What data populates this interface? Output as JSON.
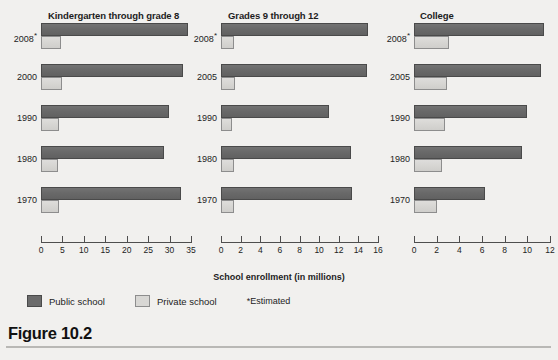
{
  "figure": {
    "caption": "Figure 10.2"
  },
  "chart_data": {
    "type": "bar",
    "orientation": "horizontal",
    "title": "",
    "xlabel": "School enrollment (in millions)",
    "ylabel": "",
    "grid": false,
    "legend_position": "bottom-left",
    "legend": [
      {
        "name": "Public school",
        "color": "#6b6b6b"
      },
      {
        "name": "Private school",
        "color": "#d8d7d4"
      }
    ],
    "note": "*Estimated",
    "panels": [
      {
        "title": "Kindergarten through grade 8",
        "categories": [
          "2008*",
          "2000",
          "1990",
          "1980",
          "1970"
        ],
        "xlim": [
          0,
          35
        ],
        "xticks": [
          0,
          5,
          10,
          15,
          20,
          25,
          30,
          35
        ],
        "series": [
          {
            "name": "Public school",
            "values": [
              34.3,
              33.1,
              29.9,
              28.6,
              32.6
            ]
          },
          {
            "name": "Private school",
            "values": [
              4.6,
              5.0,
              4.1,
              3.9,
              4.1
            ]
          }
        ]
      },
      {
        "title": "Grades 9 through 12",
        "categories": [
          "2008*",
          "2005",
          "1990",
          "1980",
          "1970"
        ],
        "xlim": [
          0,
          16
        ],
        "xticks": [
          0,
          2,
          4,
          6,
          8,
          10,
          12,
          14,
          16
        ],
        "series": [
          {
            "name": "Public school",
            "values": [
              15.0,
              14.9,
              11.0,
              13.2,
              13.4
            ]
          },
          {
            "name": "Private school",
            "values": [
              1.3,
              1.4,
              1.1,
              1.3,
              1.3
            ]
          }
        ]
      },
      {
        "title": "College",
        "categories": [
          "2008*",
          "2005",
          "1990",
          "1980",
          "1970"
        ],
        "xlim": [
          0,
          12
        ],
        "xticks": [
          0,
          2,
          4,
          6,
          8,
          10,
          12
        ],
        "series": [
          {
            "name": "Public school",
            "values": [
              11.5,
              11.2,
              10.0,
              9.5,
              6.3
            ]
          },
          {
            "name": "Private school",
            "values": [
              3.1,
              2.9,
              2.7,
              2.5,
              2.0
            ]
          }
        ]
      }
    ]
  }
}
